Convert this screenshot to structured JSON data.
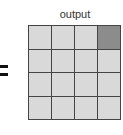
{
  "label": "output",
  "operator": "=",
  "grid": {
    "rows": 4,
    "cols": 4,
    "highlighted": [
      [
        0,
        3
      ]
    ],
    "cell_color": "#d9d9d9",
    "highlight_color": "#8c8c8c",
    "line_color": "#444444"
  }
}
